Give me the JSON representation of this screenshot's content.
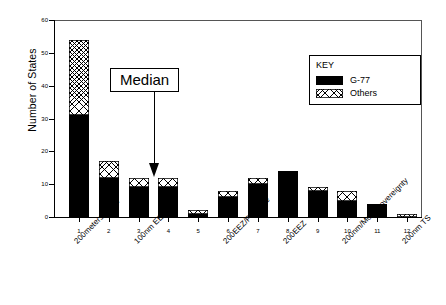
{
  "chart_data": {
    "type": "bar",
    "title": "",
    "xlabel": "",
    "ylabel": "Number of States",
    "ylim": [
      0,
      60
    ],
    "yticks": [
      0,
      10,
      20,
      30,
      40,
      50,
      60
    ],
    "grid": false,
    "stacked": true,
    "legend_position": "inside-top-right",
    "legend_title": "KEY",
    "categories": [
      "1",
      "2",
      "3",
      "4",
      "5",
      "6",
      "7",
      "8",
      "9",
      "10",
      "11",
      "12"
    ],
    "category_labels": [
      "200meters/40nm",
      "",
      "100nm EEZ",
      "",
      "",
      "200EEZ/Package",
      "",
      "200EEZ",
      "",
      "200nm/More Sovereignty",
      "",
      "200nm TS"
    ],
    "series": [
      {
        "name": "G-77",
        "values": [
          31,
          12,
          9,
          9,
          1,
          6,
          10,
          14,
          8,
          5,
          4,
          0
        ]
      },
      {
        "name": "Others",
        "values": [
          23,
          5,
          3,
          3,
          1,
          2,
          2,
          0,
          1,
          3,
          0,
          1
        ]
      }
    ],
    "totals": [
      54,
      17,
      12,
      12,
      2,
      8,
      12,
      14,
      9,
      8,
      4,
      1
    ],
    "annotations": [
      {
        "name": "median",
        "text": "Median",
        "points_to_category": "3"
      }
    ]
  },
  "legend": {
    "title": "KEY",
    "items": [
      {
        "label": "G-77",
        "pattern": "solid-black",
        "color": "#000000"
      },
      {
        "label": "Others",
        "pattern": "cross-hatch",
        "color": "#000000"
      }
    ]
  },
  "annotation": {
    "median_label": "Median"
  },
  "axes": {
    "y_label": "Number of States",
    "y_ticks": [
      "0",
      "10",
      "20",
      "30",
      "40",
      "50",
      "60"
    ],
    "x_numbers": [
      "1",
      "2",
      "3",
      "4",
      "5",
      "6",
      "7",
      "8",
      "9",
      "10",
      "11",
      "12"
    ],
    "x_categories": [
      {
        "at": "1",
        "text": "200meters/40nm"
      },
      {
        "at": "3",
        "text": "100nm EEZ"
      },
      {
        "at": "6",
        "text": "200EEZ/Package"
      },
      {
        "at": "8",
        "text": "200EEZ"
      },
      {
        "at": "10",
        "text": "200nm/More Sovereignty"
      },
      {
        "at": "12",
        "text": "200nm TS"
      }
    ]
  },
  "colors": {
    "g77": "#000000",
    "others_outline": "#000000",
    "axis": "#000000",
    "background": "#ffffff"
  }
}
